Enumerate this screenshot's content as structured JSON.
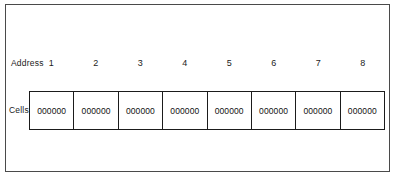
{
  "figure": {
    "rows": {
      "address": {
        "label": "Address",
        "numbers": [
          "1",
          "2",
          "3",
          "4",
          "5",
          "6",
          "7",
          "8"
        ]
      },
      "cells": {
        "label": "Cells",
        "values": [
          "000000",
          "000000",
          "000000",
          "000000",
          "000000",
          "000000",
          "000000",
          "000000"
        ]
      }
    },
    "colors": {
      "background": "#ffffff",
      "ink": "#1b1b1b",
      "frame": "#4a4a4a"
    }
  }
}
